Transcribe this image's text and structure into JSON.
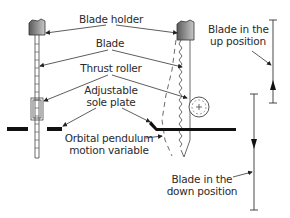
{
  "diagram": {
    "labels": {
      "blade_holder": "Blade holder",
      "blade": "Blade",
      "thrust_roller": "Thrust roller",
      "sole_plate_line1": "Adjustable",
      "sole_plate_line2": "sole plate",
      "orbital_line1": "Orbital pendulum",
      "orbital_line2": "motion variable",
      "up_line1": "Blade in the",
      "up_line2": "up position",
      "down_line1": "Blade in the",
      "down_line2": "down position"
    },
    "colors": {
      "line": "#3a3a3a",
      "fill": "#111111",
      "holder_fill": "#8a8a8a",
      "text": "#2a2a2a"
    }
  }
}
